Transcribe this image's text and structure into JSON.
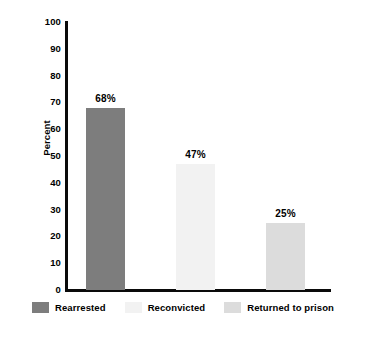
{
  "chart_data": {
    "type": "bar",
    "title": "",
    "subtitle": "",
    "xlabel": "",
    "ylabel": "Percent",
    "ylim": [
      0,
      100
    ],
    "ytick_step": 10,
    "yticks": [
      100,
      90,
      80,
      70,
      60,
      50,
      40,
      30,
      20,
      10,
      0
    ],
    "ytick_labels": [
      "100",
      "90",
      "80",
      "70",
      "60",
      "50",
      "40",
      "30",
      "20",
      "10",
      "0"
    ],
    "grid": false,
    "legend_position": "bottom",
    "categories": [
      "Rearrested",
      "Reconvicted",
      "Returned to prison"
    ],
    "values": [
      68,
      47,
      25
    ],
    "value_labels": [
      "68%",
      "47%",
      "25%"
    ],
    "colors": [
      "#7d7d7d",
      "#f2f2f2",
      "#dcdcdc"
    ],
    "series": [
      {
        "name": "Percent",
        "values": [
          68,
          47,
          25
        ]
      }
    ],
    "bars": [
      {
        "category": "Rearrested",
        "value": 68,
        "label": "68%",
        "color": "#7d7d7d"
      },
      {
        "category": "Reconvicted",
        "value": 47,
        "label": "47%",
        "color": "#f2f2f2"
      },
      {
        "category": "Returned to prison",
        "value": 25,
        "label": "25%",
        "color": "#dcdcdc"
      }
    ],
    "axis_color": "#0a0a0a",
    "background_color": "#ffffff",
    "text_color": "#000000"
  },
  "legend": {
    "items": [
      {
        "label": "Rearrested",
        "color": "#7d7d7d"
      },
      {
        "label": "Reconvicted",
        "color": "#f2f2f2"
      },
      {
        "label": "Returned to prison",
        "color": "#dcdcdc"
      }
    ]
  }
}
